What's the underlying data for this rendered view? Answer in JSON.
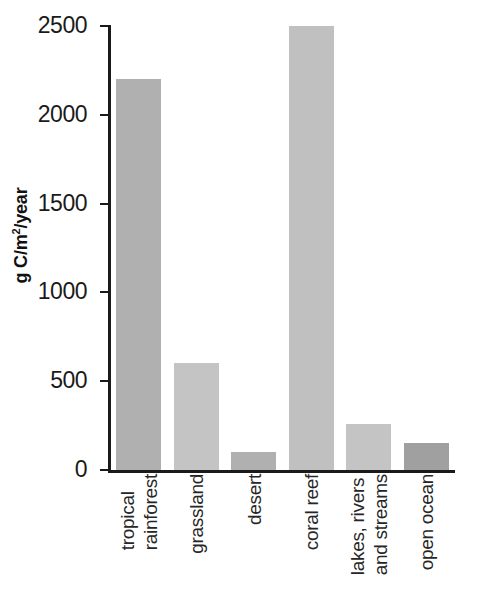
{
  "figure": {
    "caption_fragment_lines": [
      "on",
      "s"
    ]
  },
  "chart_data": {
    "type": "bar",
    "title": "",
    "xlabel": "",
    "ylabel": "g C/m2/year",
    "ylabel_html": "g C/m²/year",
    "ylim": [
      0,
      2500
    ],
    "yticks": [
      0,
      500,
      1000,
      1500,
      2000,
      2500
    ],
    "ytick_labels": [
      "0",
      "500",
      "1000",
      "1500",
      "2000",
      "2500"
    ],
    "grid": false,
    "legend": "none",
    "categories": [
      "tropical rainforest",
      "grassland",
      "desert",
      "coral reef",
      "lakes, rivers and streams",
      "open ocean"
    ],
    "category_label_lines": [
      [
        "tropical",
        "rainforest"
      ],
      [
        "grassland"
      ],
      [
        "desert"
      ],
      [
        "coral reef"
      ],
      [
        "lakes, rivers",
        "and streams"
      ],
      [
        "open ocean"
      ]
    ],
    "values": [
      2200,
      600,
      100,
      2500,
      260,
      150
    ],
    "bar_colors": [
      "#b0b0b0",
      "#c4c4c4",
      "#b0b0b0",
      "#c0c0c0",
      "#c4c4c4",
      "#a0a0a0"
    ],
    "axis_color": "#1a1a1a",
    "background": "#ffffff"
  }
}
